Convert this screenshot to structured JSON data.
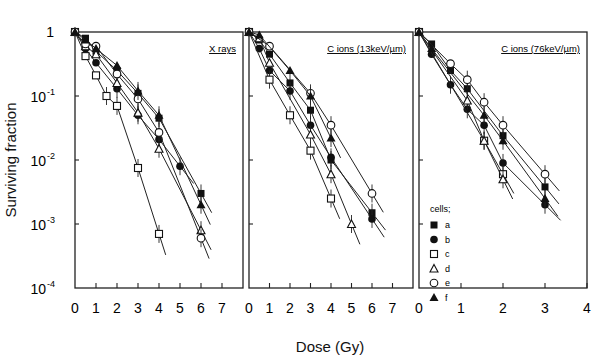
{
  "chart_data": {
    "type": "scatter",
    "title": "",
    "ylabel": "Surviving fraction",
    "xlabel": "Dose (Gy)",
    "yscale": "log",
    "ylim": [
      0.0001,
      1
    ],
    "yticks": [
      "1",
      "10^-1",
      "10^-2",
      "10^-3",
      "10^-4"
    ],
    "legend": {
      "title": "cells;",
      "position": "inside panel 3, lower-left",
      "entries": [
        {
          "key": "a",
          "marker": "filled-square"
        },
        {
          "key": "b",
          "marker": "filled-circle"
        },
        {
          "key": "c",
          "marker": "open-square"
        },
        {
          "key": "d",
          "marker": "open-triangle"
        },
        {
          "key": "e",
          "marker": "open-circle"
        },
        {
          "key": "f",
          "marker": "filled-triangle"
        }
      ]
    },
    "panels": [
      {
        "title": "X rays",
        "xlim": [
          0,
          8
        ],
        "xticks": [
          0,
          1,
          2,
          3,
          4,
          5,
          6,
          7
        ],
        "series": [
          {
            "name": "a",
            "x": [
              0,
              0.5,
              1,
              2,
              3,
              4,
              6
            ],
            "y": [
              1,
              0.8,
              0.5,
              0.25,
              0.11,
              0.045,
              0.003
            ]
          },
          {
            "name": "b",
            "x": [
              0,
              0.5,
              1,
              2,
              3,
              4,
              5
            ],
            "y": [
              1,
              0.55,
              0.33,
              0.13,
              0.05,
              0.021,
              0.008
            ]
          },
          {
            "name": "c",
            "x": [
              0,
              0.5,
              1,
              1.5,
              2,
              3,
              4
            ],
            "y": [
              1,
              0.42,
              0.21,
              0.1,
              0.07,
              0.0075,
              0.0007
            ]
          },
          {
            "name": "d",
            "x": [
              0,
              0.5,
              1,
              2,
              3,
              4,
              6
            ],
            "y": [
              1,
              0.6,
              0.45,
              0.16,
              0.055,
              0.015,
              0.0008
            ]
          },
          {
            "name": "e",
            "x": [
              0,
              0.5,
              1,
              2,
              3,
              4,
              6
            ],
            "y": [
              1,
              0.65,
              0.6,
              0.22,
              0.09,
              0.027,
              0.0006
            ]
          },
          {
            "name": "f",
            "x": [
              0,
              0.5,
              1,
              2,
              3,
              4,
              6
            ],
            "y": [
              1,
              0.75,
              0.55,
              0.3,
              0.12,
              0.05,
              0.002
            ]
          }
        ]
      },
      {
        "title": "C ions (13keV/µm)",
        "xlim": [
          0,
          8
        ],
        "xticks": [
          0,
          1,
          2,
          3,
          4,
          5,
          6,
          7
        ],
        "series": [
          {
            "name": "a",
            "x": [
              0,
              0.5,
              1,
              2,
              3,
              4,
              6
            ],
            "y": [
              1,
              0.75,
              0.45,
              0.16,
              0.06,
              0.01,
              0.0015
            ]
          },
          {
            "name": "b",
            "x": [
              0,
              0.5,
              1,
              2,
              3,
              4,
              6
            ],
            "y": [
              1,
              0.55,
              0.25,
              0.12,
              0.035,
              0.011,
              0.0012
            ]
          },
          {
            "name": "c",
            "x": [
              0,
              1,
              2,
              3,
              4
            ],
            "y": [
              1,
              0.18,
              0.05,
              0.014,
              0.0025
            ]
          },
          {
            "name": "d",
            "x": [
              0,
              0.5,
              1,
              3,
              4,
              5
            ],
            "y": [
              1,
              0.8,
              0.33,
              0.025,
              0.006,
              0.001
            ]
          },
          {
            "name": "e",
            "x": [
              0,
              1,
              3,
              4,
              6
            ],
            "y": [
              1,
              0.6,
              0.11,
              0.035,
              0.003
            ]
          },
          {
            "name": "f",
            "x": [
              0,
              0.5,
              2,
              3,
              4
            ],
            "y": [
              1,
              0.9,
              0.25,
              0.1,
              0.022
            ]
          }
        ]
      },
      {
        "title": "C ions (76keV/µm)",
        "xlim": [
          0,
          4
        ],
        "xticks": [
          0,
          1,
          2,
          3,
          4
        ],
        "series": [
          {
            "name": "a",
            "x": [
              0,
              0.3,
              0.75,
              1.15,
              2,
              3
            ],
            "y": [
              1,
              0.65,
              0.25,
              0.13,
              0.024,
              0.0038
            ]
          },
          {
            "name": "b",
            "x": [
              0,
              0.3,
              0.75,
              1.15,
              1.55,
              2,
              3
            ],
            "y": [
              1,
              0.45,
              0.15,
              0.062,
              0.035,
              0.009,
              0.002
            ]
          },
          {
            "name": "c",
            "x": [
              0,
              1.55,
              2
            ],
            "y": [
              1,
              0.02,
              0.006
            ]
          },
          {
            "name": "d",
            "x": [
              0,
              1.15,
              1.55,
              2
            ],
            "y": [
              1,
              0.085,
              0.02,
              0.005
            ]
          },
          {
            "name": "e",
            "x": [
              0,
              0.75,
              1.15,
              1.55,
              2,
              3
            ],
            "y": [
              1,
              0.32,
              0.18,
              0.08,
              0.035,
              0.006
            ]
          },
          {
            "name": "f",
            "x": [
              0,
              0.3,
              1.55,
              2,
              3
            ],
            "y": [
              1,
              0.55,
              0.05,
              0.02,
              0.0025
            ]
          }
        ]
      }
    ]
  }
}
